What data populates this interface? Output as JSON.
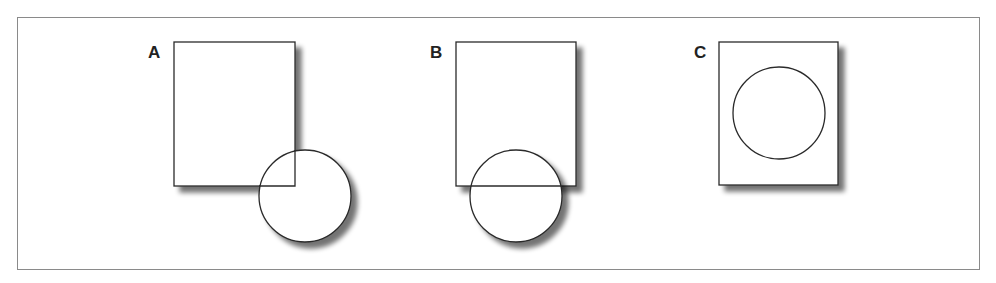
{
  "diagram": {
    "panels": [
      {
        "label": "A",
        "rect": {
          "x": 174,
          "y": 42,
          "w": 121,
          "h": 144
        },
        "circle": {
          "cx": 305,
          "cy": 196,
          "r": 46
        },
        "relation": "circle overlaps bottom-right corner"
      },
      {
        "label": "B",
        "rect": {
          "x": 456,
          "y": 42,
          "w": 120,
          "h": 144
        },
        "circle": {
          "cx": 516,
          "cy": 196,
          "r": 46
        },
        "relation": "circle centered on bottom edge"
      },
      {
        "label": "C",
        "rect": {
          "x": 719,
          "y": 42,
          "w": 119,
          "h": 143
        },
        "circle": {
          "cx": 779,
          "cy": 113,
          "r": 46
        },
        "relation": "circle fully inside rectangle"
      }
    ],
    "colors": {
      "stroke": "#2a2a2a",
      "shadow": "#9a9a9a",
      "frame": "#8a8a8a",
      "fill": "#ffffff"
    }
  }
}
